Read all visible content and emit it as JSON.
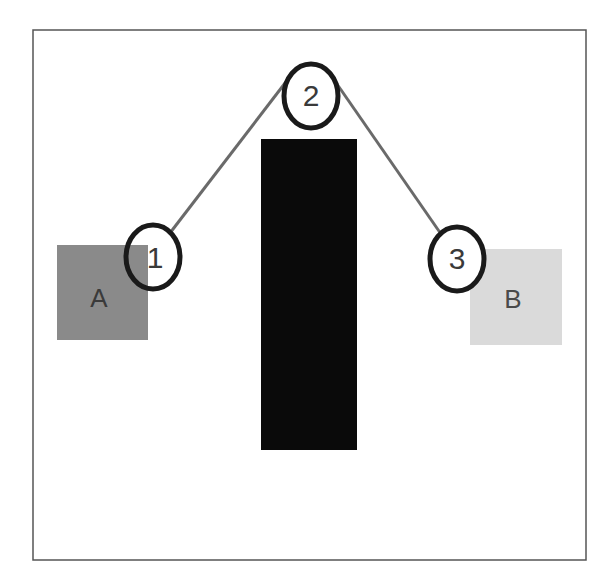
{
  "diagram": {
    "frame": {
      "x": 33,
      "y": 30,
      "width": 553,
      "height": 530,
      "stroke": "#555555"
    },
    "boxes": [
      {
        "id": "A",
        "label": "A",
        "x": 57,
        "y": 245,
        "width": 91,
        "height": 95,
        "fill": "#8a8a8a",
        "text_color": "#3a3a3a"
      },
      {
        "id": "B",
        "label": "B",
        "x": 470,
        "y": 249,
        "width": 92,
        "height": 96,
        "fill": "#dadada",
        "text_color": "#4a4a4a"
      }
    ],
    "obstacle": {
      "x": 261,
      "y": 139,
      "width": 96,
      "height": 311,
      "fill": "#0a0a0a"
    },
    "nodes": [
      {
        "id": "1",
        "label": "1",
        "cx": 153,
        "cy": 257,
        "rx": 27,
        "ry": 32
      },
      {
        "id": "2",
        "label": "2",
        "cx": 311,
        "cy": 96,
        "rx": 27,
        "ry": 32
      },
      {
        "id": "3",
        "label": "3",
        "cx": 457,
        "cy": 259,
        "rx": 27,
        "ry": 32
      }
    ],
    "edges": [
      {
        "from": "1",
        "to": "2"
      },
      {
        "from": "2",
        "to": "3"
      }
    ],
    "colors": {
      "node_stroke": "#1a1a1a",
      "node_text": "#3a3a3a",
      "edge": "#6a6a6a"
    }
  }
}
